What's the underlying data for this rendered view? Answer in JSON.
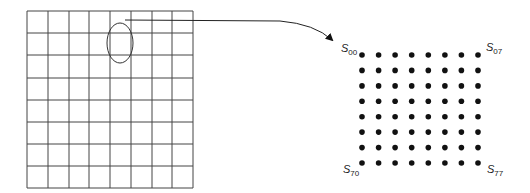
{
  "diagram": {
    "grid": {
      "rows": 8,
      "cols": 8,
      "x_lines": [
        27,
        48,
        69,
        89,
        110,
        131,
        152,
        172,
        193
      ],
      "y_lines": [
        11,
        33,
        55,
        78,
        100,
        122,
        144,
        166,
        188
      ],
      "line_color": "#444444"
    },
    "highlight_ellipse": {
      "cx": 120,
      "cy": 43,
      "rx": 13,
      "ry": 20,
      "stroke": "#333333"
    },
    "arrow": {
      "path": "M125 20 L280 21 Q315 24 332 40",
      "stroke": "#222222"
    },
    "dot_matrix": {
      "rows": 8,
      "cols": 8,
      "x_start": 362,
      "x_end": 478,
      "y_start": 55,
      "y_end": 163,
      "radius": 2.8,
      "color": "#111111"
    },
    "corner_labels": [
      {
        "id": "s00",
        "symbol": "S",
        "subscript": "00",
        "x": 341,
        "y": 43
      },
      {
        "id": "s07",
        "symbol": "S",
        "subscript": "07",
        "x": 486,
        "y": 42
      },
      {
        "id": "s70",
        "symbol": "S",
        "subscript": "70",
        "x": 343,
        "y": 164
      },
      {
        "id": "s77",
        "symbol": "S",
        "subscript": "77",
        "x": 487,
        "y": 164
      }
    ]
  }
}
